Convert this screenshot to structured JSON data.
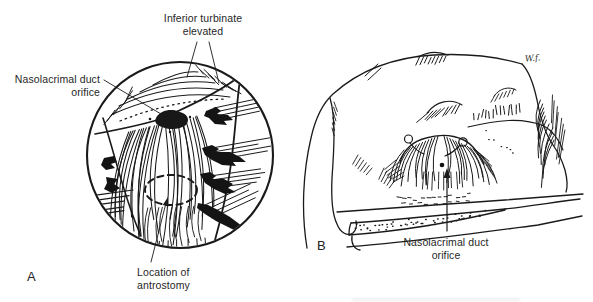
{
  "figure": {
    "background": "#ffffff",
    "ink_color": "#1a1a1a"
  },
  "panel_a": {
    "letter": "A",
    "labels": {
      "inferior_turbinate": {
        "line1": "Inferior turbinate",
        "line2": "elevated"
      },
      "nasolacrimal_duct": {
        "line1": "Nasolacrimal duct",
        "line2": "orifice"
      },
      "antrostomy": {
        "line1": "Location of",
        "line2": "antrostomy"
      }
    }
  },
  "panel_b": {
    "letter": "B",
    "labels": {
      "nasolacrimal_duct": {
        "line1": "Nasolacrimal duct",
        "line2": "orifice"
      }
    },
    "signature": "W.f."
  }
}
